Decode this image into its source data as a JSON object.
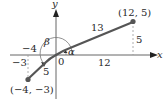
{
  "figure": {
    "type": "coordinate-angle-diagram",
    "axes": {
      "x_label": "x",
      "y_label": "y",
      "origin_label": "0"
    },
    "points": [
      {
        "label": "(12, 5)",
        "x": 12,
        "y": 5
      },
      {
        "label": "(−4, −3)",
        "x": -4,
        "y": -3
      }
    ],
    "segments": [
      {
        "from": "origin",
        "to": "(12, 5)",
        "length_label": "13",
        "horizontal_label": "12",
        "vertical_label": "5"
      },
      {
        "from": "origin",
        "to": "(−4, −3)",
        "length_label": "5",
        "horizontal_label": "−4",
        "vertical_label": "−3"
      }
    ],
    "angles": [
      {
        "label": "α",
        "description": "angle from positive x-axis to segment to (12, 5)"
      },
      {
        "label": "β",
        "description": "angle from positive x-axis to segment to (−4, −3)"
      }
    ],
    "colors": {
      "segment": "#555555",
      "axis": "#333333",
      "dashed": "#999999",
      "arc": "#777777",
      "text": "#2a2a2a"
    }
  }
}
